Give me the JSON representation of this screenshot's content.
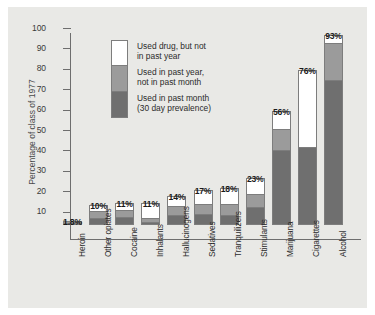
{
  "chart_data": {
    "type": "bar",
    "subtype": "stacked-bar",
    "title": "",
    "xlabel": "",
    "ylabel": "Percentage of class of 1977",
    "ylim": [
      0,
      100
    ],
    "yticks": [
      100,
      90,
      80,
      70,
      60,
      50,
      40,
      30,
      20,
      10
    ],
    "grid": false,
    "legend_position": "inside-top-left",
    "categories": [
      "Heroin",
      "Other opiates",
      "Cocaine",
      "Inhalants",
      "Hallucinogens",
      "Sedatives",
      "Tranquilizers",
      "Stimulants",
      "Marijuana",
      "Cigarettes",
      "Alcohol"
    ],
    "total_labels": [
      "1.8%",
      "10%",
      "11%",
      "11%",
      "14%",
      "17%",
      "18%",
      "23%",
      "56%",
      "76%",
      "93%"
    ],
    "totals": [
      1.8,
      10,
      11,
      11,
      14,
      17,
      18,
      23,
      56,
      76,
      93
    ],
    "series": [
      {
        "name": "Used in past month (30 day prevalence)",
        "color": "#6f6f6f",
        "values": [
          0.8,
          3.5,
          4.0,
          1.5,
          5.0,
          5.5,
          5.0,
          9.0,
          37.0,
          38.0,
          71.0
        ]
      },
      {
        "name": "Used in past year, not in past month",
        "color": "#9b9b9b",
        "values": [
          1.0,
          3.5,
          3.5,
          2.0,
          4.5,
          5.0,
          5.5,
          6.0,
          10.0,
          0.0,
          18.0
        ]
      },
      {
        "name": "Used drug, but not in past year",
        "color": "#ffffff",
        "values": [
          0.0,
          3.0,
          3.5,
          7.5,
          4.5,
          6.5,
          7.5,
          8.0,
          9.0,
          38.0,
          4.0
        ]
      }
    ],
    "annotations": [
      {
        "target_category": "Cigarettes",
        "line1": "ANNUAL USE",
        "line2": "NOT MEASURED"
      }
    ]
  },
  "legend": {
    "entries": [
      {
        "line1": "Used drug, but not",
        "line2": "in past year",
        "color": "#ffffff"
      },
      {
        "line1": "Used in past year,",
        "line2": "not in past month",
        "color": "#9b9b9b"
      },
      {
        "line1": "Used in past month",
        "line2": "(30 day prevalence)",
        "color": "#6f6f6f"
      }
    ]
  },
  "axis": {
    "y_tick_100": "100",
    "y_tick_90": "90",
    "y_tick_80": "80",
    "y_tick_70": "70",
    "y_tick_60": "60",
    "y_tick_50": "50",
    "y_tick_40": "40",
    "y_tick_30": "30",
    "y_tick_20": "20",
    "y_tick_10": "10",
    "y_axis_title": "Percentage of class of 1977"
  },
  "colors": {
    "panel_background": "#e9e9e6",
    "page_background": "#ffffff",
    "axis": "#6e6e6e",
    "bar_outline": "#7d7d7d",
    "segment_white": "#ffffff",
    "segment_mid": "#9b9b9b",
    "segment_dark": "#6f6f6f",
    "text": "#2b2b2b"
  }
}
